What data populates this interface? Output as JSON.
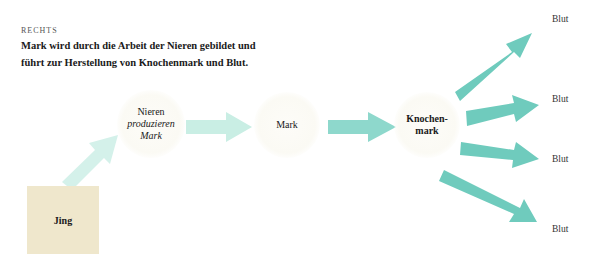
{
  "header": {
    "label": "RECHTS",
    "caption": "Mark wird durch die Arbeit der Nieren gebildet und führt zur Herstellung von Knochenmark und Blut."
  },
  "nodes": {
    "jing": "Jing",
    "nieren": {
      "line1": "Nieren",
      "line2": "produzieren",
      "line3": "Mark"
    },
    "mark": "Mark",
    "knochenmark": {
      "line1": "Knochen-",
      "line2": "mark"
    }
  },
  "outputs": [
    "Blut",
    "Blut",
    "Blut",
    "Blut"
  ],
  "colors": {
    "arrow_light": "#c9eee4",
    "arrow_dark": "#6fcbbd",
    "jing_box": "#efe7cc"
  }
}
